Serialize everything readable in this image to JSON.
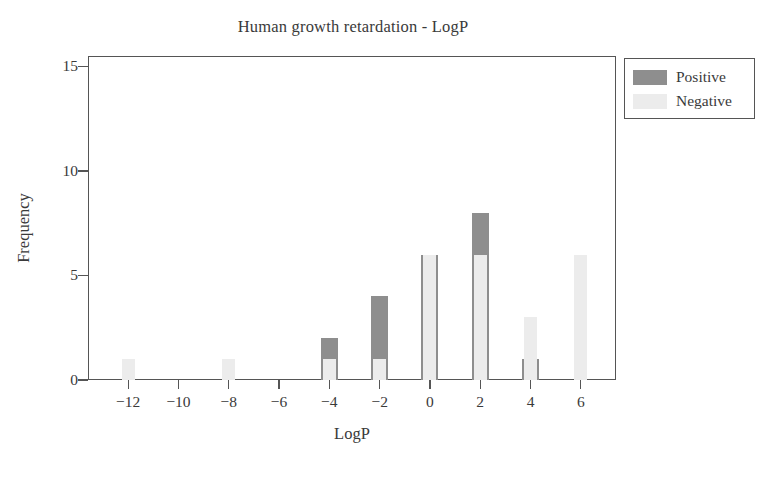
{
  "chart_data": {
    "type": "bar",
    "title": "Human growth retardation - LogP",
    "xlabel": "LogP",
    "ylabel": "Frequency",
    "x": [
      -12,
      -10,
      -8,
      -6,
      -4,
      -2,
      0,
      2,
      4,
      6
    ],
    "xtick_labels": [
      "−12",
      "−10",
      "−8",
      "−6",
      "−4",
      "−2",
      "0",
      "2",
      "4",
      "6"
    ],
    "ytick_labels": [
      "0",
      "5",
      "10",
      "15"
    ],
    "yticks": [
      0,
      5,
      10,
      15
    ],
    "ylim": [
      0,
      15.5
    ],
    "xlim": [
      -13.6,
      7.4
    ],
    "grid": false,
    "legend_position": "outside-top-right",
    "series": [
      {
        "name": "Positive",
        "color": "#8e8e8e",
        "values": [
          0,
          0,
          0,
          0,
          2,
          4,
          6,
          8,
          1,
          0
        ]
      },
      {
        "name": "Negative",
        "color": "#ececec",
        "values": [
          1,
          0,
          1,
          0,
          1,
          1,
          6,
          6,
          3,
          6
        ]
      }
    ]
  },
  "legend": {
    "entries": [
      {
        "label": "Positive",
        "color": "#8e8e8e"
      },
      {
        "label": "Negative",
        "color": "#ececec"
      }
    ]
  }
}
